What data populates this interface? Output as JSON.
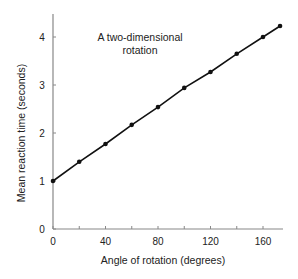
{
  "chart_data": {
    "type": "line",
    "title": "",
    "annotation": [
      "A two-dimensional",
      "rotation"
    ],
    "xlabel": "Angle of rotation (degrees)",
    "ylabel": "Mean reaction time (seconds)",
    "xlim": [
      0,
      180
    ],
    "ylim": [
      0,
      4.5
    ],
    "xticks": [
      0,
      40,
      80,
      120,
      160
    ],
    "xminor_ticks": [
      20,
      60,
      100,
      140
    ],
    "yticks": [
      0,
      1,
      2,
      3,
      4
    ],
    "grid": false,
    "legend": null,
    "series": [
      {
        "name": "Mean reaction time",
        "color": "#111111",
        "marker": "circle",
        "x": [
          0,
          20,
          40,
          60,
          80,
          100,
          120,
          140,
          160,
          173
        ],
        "y": [
          1.0,
          1.4,
          1.77,
          2.17,
          2.54,
          2.94,
          3.27,
          3.65,
          4.0,
          4.23
        ]
      }
    ]
  },
  "colors": {
    "axis": "#888888",
    "line": "#111111",
    "text": "#222222",
    "background": "#ffffff"
  }
}
